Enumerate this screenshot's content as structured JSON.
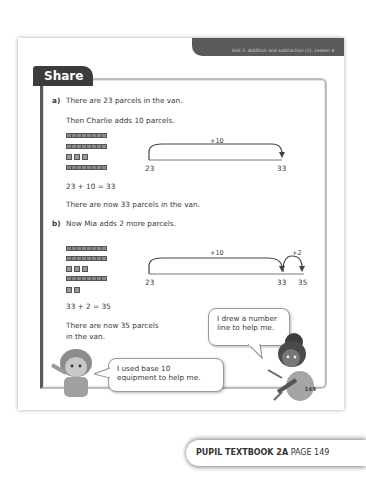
{
  "header": {
    "unit_banner": "Unit 5: Addition and subtraction (2), Lesson 4",
    "section_title": "Share"
  },
  "part_a": {
    "label": "a)",
    "line1": "There are 23 parcels in the van.",
    "line2": "Then Charlie adds 10 parcels.",
    "base10": {
      "tens_rods_top": 2,
      "ones_cubes": 3,
      "tens_rods_added": 1
    },
    "number_line": {
      "start": "23",
      "end": "33",
      "jump_label": "+10"
    },
    "equation": "23 + 10 = 33",
    "result": "There are now 33 parcels in the van."
  },
  "part_b": {
    "label": "b)",
    "line1": "Now Mia adds 2 more parcels.",
    "base10": {
      "tens_rods_top": 2,
      "ones_cubes": 3,
      "tens_rods_added": 1,
      "ones_added": 2
    },
    "number_line": {
      "start": "23",
      "mid": "33",
      "end": "35",
      "jump1_label": "+10",
      "jump2_label": "+2"
    },
    "equation": "33 + 2 = 35",
    "result_line1": "There are now 35 parcels",
    "result_line2": "in the van."
  },
  "bubbles": {
    "right_line1": "I drew a number",
    "right_line2": "line to help me.",
    "left_line1": "I used base 10",
    "left_line2": "equipment to help me."
  },
  "page_number": "149",
  "footer": {
    "book": "PUPIL TEXTBOOK 2A",
    "page": "PAGE 149"
  }
}
